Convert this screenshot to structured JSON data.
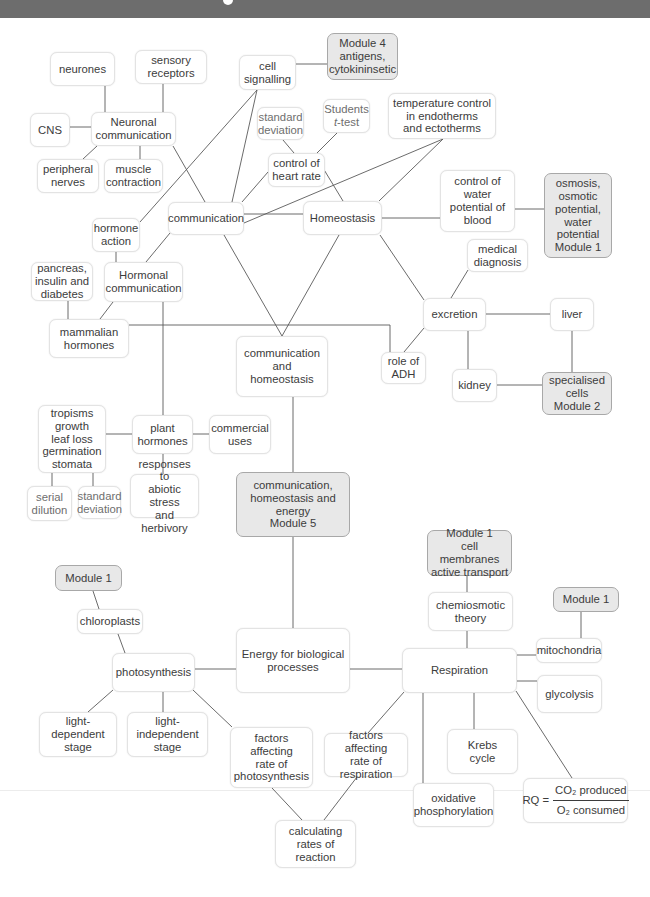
{
  "diagram": {
    "nodes": {
      "neurones": "neurones",
      "sensory_receptors": "sensory\nreceptors",
      "cell_signalling": "cell\nsignalling",
      "module4": "Module 4\nantigens,\ncytokininsetic",
      "cns": "CNS",
      "neuronal_communication": "Neuronal\ncommunication",
      "standard_deviation_top": "standard\ndeviation",
      "students_line1": "Students",
      "students_t": "t",
      "students_test": "-test",
      "temperature_control": "temperature control\nin endotherms\nand ectotherms",
      "peripheral_nerves": "peripheral\nnerves",
      "muscle_contraction": "muscle\ncontraction",
      "control_heart_rate": "control of\nheart rate",
      "communication": "communication",
      "homeostasis": "Homeostasis",
      "control_water_potential": "control of\nwater\npotential of\nblood",
      "osmosis_module1": "osmosis,\nosmotic\npotential,\nwater\npotential\nModule 1",
      "hormone_action": "hormone\naction",
      "pancreas": "pancreas,\ninsulin and\ndiabetes",
      "hormonal_communication": "Hormonal\ncommunication",
      "mammalian_hormones": "mammalian\nhormones",
      "communication_and_homeostasis": "communication\nand\nhomeostasis",
      "medical_diagnosis": "medical\ndiagnosis",
      "excretion": "excretion",
      "liver": "liver",
      "role_of_adh": "role of\nADH",
      "kidney": "kidney",
      "specialised_cells": "specialised\ncells\nModule 2",
      "tropisms": "tropisms\ngrowth\nleaf loss\ngermination\nstomata",
      "plant_hormones": "plant\nhormones",
      "commercial_uses": "commercial\nuses",
      "serial_dilution": "serial\ndilution",
      "standard_deviation_low": "standard\ndeviation",
      "responses_abiotic": "responses to\nabiotic stress\nand herbivory",
      "module5": "communication,\nhomeostasis and\nenergy\nModule 5",
      "module1_membranes": "Module 1\ncell membranes\nactive transport",
      "module1_right": "Module 1",
      "chemiosmotic_theory": "chemiosmotic\ntheory",
      "module1_left": "Module 1",
      "chloroplasts": "chloroplasts",
      "photosynthesis": "photosynthesis",
      "energy_biological": "Energy for biological\nprocesses",
      "mitochondria": "mitochondria",
      "respiration": "Respiration",
      "glycolysis": "glycolysis",
      "light_dependent": "light-dependent\nstage",
      "light_independent": "light-independent\nstage",
      "factors_photosynthesis": "factors\naffecting\nrate of\nphotosynthesis",
      "factors_respiration": "factors affecting\nrate of\nrespiration",
      "krebs_cycle": "Krebs\ncycle",
      "oxidative_phosphorylation": "oxidative\nphosphorylation",
      "rq_label": "RQ =",
      "rq_numerator": "CO₂ produced",
      "rq_denominator": "O₂ consumed",
      "calculating_rates": "calculating\nrates of reaction"
    },
    "colors": {
      "module_fill": "#e8e8e8",
      "module_border": "#a8a8a8",
      "node_border": "#e3e3e3",
      "line": "#5a5a5a",
      "text": "#3c3c3c",
      "header_band": "#6d6d6d"
    }
  }
}
